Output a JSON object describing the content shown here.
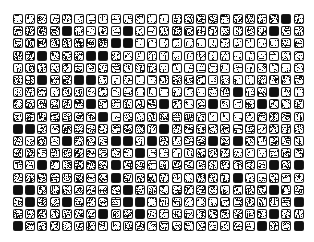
{
  "page": {
    "background_color": "#ffffff"
  },
  "grid": {
    "name": "icon-thumbnail-grid",
    "columns": 24,
    "rows": 18,
    "total_cells": 432,
    "origin_x": 13,
    "origin_y": 14,
    "cell_pitch_x": 12.2,
    "cell_pitch_y": 12.2,
    "tile_size": 10,
    "tile_corner_radius": 2,
    "border_color": "#1a1a1a",
    "border_width": 1,
    "interior_color": "#ffffff",
    "glyph_color": "#111111",
    "description": "Grid of small rounded-square tiles; each tile contains a dense noisy dark glyph. Fill density varies per tile from near-empty to solid black.",
    "density_levels": [
      0,
      1,
      2,
      3,
      4,
      5,
      6,
      7,
      8,
      9
    ],
    "density_map": [
      [
        1,
        2,
        4,
        2,
        3,
        1,
        1,
        1,
        1,
        2,
        2,
        1,
        1,
        3,
        4,
        4,
        4,
        3,
        4,
        4,
        3,
        5,
        9,
        3,
        9
      ],
      [
        4,
        4,
        5,
        4,
        9,
        3,
        1,
        3,
        1,
        9,
        2,
        1,
        3,
        6,
        5,
        4,
        4,
        4,
        3,
        4,
        4,
        9,
        3,
        4
      ],
      [
        3,
        5,
        5,
        3,
        4,
        5,
        5,
        6,
        9,
        9,
        1,
        1,
        1,
        1,
        1,
        1,
        1,
        2,
        1,
        1,
        1,
        1,
        3,
        3
      ],
      [
        5,
        6,
        9,
        3,
        4,
        4,
        9,
        9,
        4,
        2,
        1,
        2,
        1,
        1,
        1,
        2,
        1,
        2,
        1,
        1,
        1,
        1,
        2,
        2
      ],
      [
        2,
        4,
        4,
        2,
        3,
        4,
        3,
        3,
        3,
        2,
        3,
        3,
        1,
        2,
        1,
        1,
        2,
        1,
        1,
        1,
        2,
        2,
        1,
        2
      ],
      [
        4,
        5,
        9,
        4,
        5,
        9,
        9,
        3,
        1,
        2,
        1,
        1,
        3,
        4,
        3,
        4,
        1,
        3,
        1,
        1,
        4,
        4,
        4,
        4
      ],
      [
        2,
        4,
        4,
        2,
        3,
        4,
        2,
        4,
        1,
        2,
        2,
        1,
        1,
        2,
        1,
        1,
        2,
        3,
        9,
        2,
        3,
        9,
        2,
        1
      ],
      [
        4,
        5,
        4,
        4,
        4,
        5,
        9,
        3,
        2,
        3,
        3,
        4,
        9,
        3,
        1,
        3,
        9,
        2,
        1,
        4,
        9,
        3,
        2,
        3
      ],
      [
        4,
        5,
        5,
        4,
        4,
        4,
        3,
        9,
        1,
        3,
        2,
        4,
        4,
        3,
        5,
        3,
        1,
        1,
        1,
        2,
        3,
        4,
        4,
        2
      ],
      [
        9,
        9,
        4,
        3,
        5,
        4,
        4,
        4,
        4,
        5,
        4,
        3,
        9,
        4,
        4,
        4,
        4,
        3,
        3,
        3,
        2,
        4,
        4,
        3
      ],
      [
        3,
        2,
        5,
        2,
        9,
        4,
        4,
        4,
        9,
        9,
        2,
        9,
        4,
        2,
        4,
        4,
        9,
        4,
        9,
        4,
        2,
        4,
        4,
        2
      ],
      [
        4,
        5,
        2,
        4,
        4,
        5,
        3,
        3,
        3,
        2,
        9,
        1,
        1,
        1,
        2,
        4,
        4,
        3,
        2,
        1,
        1,
        2,
        4,
        3
      ],
      [
        3,
        2,
        9,
        3,
        4,
        5,
        5,
        4,
        9,
        5,
        4,
        2,
        3,
        5,
        3,
        3,
        3,
        4,
        3,
        3,
        3,
        9,
        4,
        9
      ],
      [
        3,
        4,
        5,
        4,
        4,
        5,
        3,
        4,
        9,
        4,
        4,
        5,
        3,
        2,
        2,
        5,
        4,
        3,
        9,
        2,
        2,
        3,
        2,
        3
      ],
      [
        9,
        9,
        4,
        4,
        4,
        4,
        4,
        3,
        4,
        9,
        4,
        4,
        3,
        3,
        4,
        4,
        4,
        4,
        4,
        4,
        4,
        9,
        4,
        4
      ],
      [
        3,
        9,
        4,
        3,
        9,
        3,
        3,
        4,
        3,
        9,
        9,
        2,
        3,
        3,
        2,
        2,
        2,
        3,
        3,
        4,
        3,
        3,
        3,
        9
      ],
      [
        4,
        4,
        5,
        4,
        3,
        4,
        3,
        9,
        3,
        4,
        9,
        2,
        2,
        3,
        3,
        3,
        4,
        3,
        4,
        3,
        3,
        9,
        3,
        3
      ],
      [
        9,
        4,
        4,
        3,
        2,
        3,
        4,
        3,
        2,
        3,
        4,
        2,
        4,
        3,
        3,
        3,
        2,
        2,
        3,
        2,
        9,
        3,
        3,
        9
      ],
      [
        2,
        4,
        9,
        2,
        3,
        4,
        2,
        2,
        2,
        2,
        4,
        9,
        9,
        2,
        2,
        1,
        2,
        2,
        2,
        2,
        2,
        2,
        2,
        2
      ]
    ]
  }
}
